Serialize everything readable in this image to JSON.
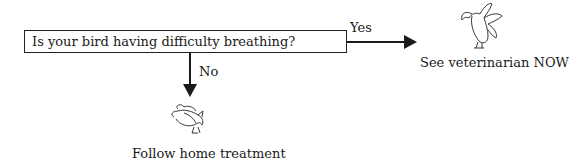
{
  "flowchart": {
    "question": "Is your bird having difficulty breathing?",
    "branches": [
      {
        "label": "Yes",
        "outcome": "See veterinarian NOW",
        "icon": "alert-parrot-icon"
      },
      {
        "label": "No",
        "outcome": "Follow home treatment",
        "icon": "resting-bird-icon"
      }
    ]
  },
  "colors": {
    "line": "#1a1a1a",
    "background": "#ffffff"
  }
}
